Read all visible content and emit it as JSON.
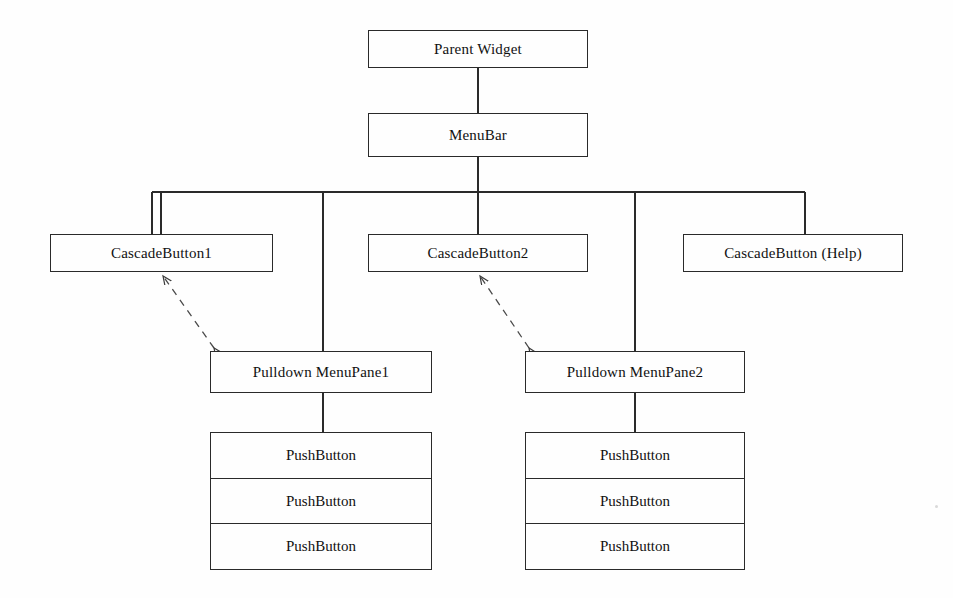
{
  "diagram": {
    "type": "tree",
    "background_color": "#fefefe",
    "line_color": "#2a2a2a",
    "text_color": "#111111",
    "nodes": {
      "parent_widget": {
        "label": "Parent Widget",
        "x": 368,
        "y": 30,
        "w": 220,
        "h": 38
      },
      "menubar": {
        "label": "MenuBar",
        "x": 368,
        "y": 113,
        "w": 220,
        "h": 44
      },
      "cascade_button_1": {
        "label": "CascadeButton1",
        "x": 50,
        "y": 234,
        "w": 223,
        "h": 38
      },
      "cascade_button_2": {
        "label": "CascadeButton2",
        "x": 368,
        "y": 234,
        "w": 220,
        "h": 38
      },
      "cascade_button_help": {
        "label": "CascadeButton (Help)",
        "x": 683,
        "y": 234,
        "w": 220,
        "h": 38
      },
      "menupane_1": {
        "label": "Pulldown MenuPane1",
        "x": 210,
        "y": 351,
        "w": 222,
        "h": 42
      },
      "menupane_2": {
        "label": "Pulldown MenuPane2",
        "x": 525,
        "y": 351,
        "w": 220,
        "h": 42
      }
    },
    "stacks": {
      "pushbuttons_1": {
        "x": 210,
        "y": 432,
        "w": 222,
        "h": 138,
        "rows": [
          "PushButton",
          "PushButton",
          "PushButton"
        ]
      },
      "pushbuttons_2": {
        "x": 525,
        "y": 432,
        "w": 220,
        "h": 138,
        "rows": [
          "PushButton",
          "PushButton",
          "PushButton"
        ]
      }
    },
    "edges": [
      {
        "from": "parent_widget",
        "to": "menubar",
        "style": "solid"
      },
      {
        "from": "menubar",
        "to": "bus",
        "style": "solid"
      },
      {
        "from": "bus",
        "to": "cascade_button_1",
        "style": "solid"
      },
      {
        "from": "bus",
        "to": "cascade_button_2",
        "style": "solid"
      },
      {
        "from": "bus",
        "to": "cascade_button_help",
        "style": "solid"
      },
      {
        "from": "bus",
        "to": "menupane_1",
        "style": "solid"
      },
      {
        "from": "bus",
        "to": "menupane_2",
        "style": "solid"
      },
      {
        "from": "menupane_1",
        "to": "pushbuttons_1",
        "style": "solid"
      },
      {
        "from": "menupane_2",
        "to": "pushbuttons_2",
        "style": "solid"
      },
      {
        "from": "menupane_1",
        "to": "cascade_button_1",
        "style": "dashed",
        "arrowheads": "both"
      },
      {
        "from": "menupane_2",
        "to": "cascade_button_2",
        "style": "dashed",
        "arrowheads": "both"
      }
    ],
    "bus": {
      "y": 192,
      "x_start": 152,
      "x_end": 805
    }
  }
}
